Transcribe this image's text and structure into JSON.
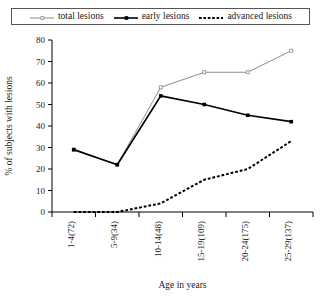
{
  "chart_data": {
    "type": "line",
    "title": "",
    "xlabel": "Age in years",
    "ylabel": "% of subjects with lesions",
    "categories": [
      "1-4(72)",
      "5-9(34)",
      "10-14(48)",
      "15-19(109)",
      "20-24(175)",
      "25-29(137)"
    ],
    "ylim": [
      0,
      80
    ],
    "yticks": [
      0,
      10,
      20,
      30,
      40,
      50,
      60,
      70,
      80
    ],
    "grid": false,
    "legend_position": "top",
    "series": [
      {
        "name": "total lesions",
        "values": [
          29,
          22,
          58,
          65,
          65,
          75
        ],
        "color": "#8c8c8c",
        "style": "solid-thin",
        "marker": "open-square"
      },
      {
        "name": "early lesions",
        "values": [
          29,
          22,
          54,
          50,
          45,
          42
        ],
        "color": "#000000",
        "style": "solid-thick",
        "marker": "filled-square"
      },
      {
        "name": "advanced lesions",
        "values": [
          0,
          0,
          4,
          15,
          20,
          33
        ],
        "color": "#000000",
        "style": "dotted-thick",
        "marker": "none"
      }
    ]
  },
  "legend": {
    "items": [
      {
        "label": "total lesions",
        "icon": "thin-gray-line-icon"
      },
      {
        "label": "early lesions",
        "icon": "thick-black-line-square-marker-icon"
      },
      {
        "label": "advanced lesions",
        "icon": "dotted-black-line-icon"
      }
    ]
  },
  "axes": {
    "y_title": "% of subjects with lesions",
    "x_title": "Age in years",
    "y_tick_labels": [
      "80",
      "70",
      "60",
      "50",
      "40",
      "30",
      "20",
      "10",
      "0"
    ],
    "x_tick_labels": [
      "1-4(72)",
      "5-9(34)",
      "10-14(48)",
      "15-19(109)",
      "20-24(175)",
      "25-29(137)"
    ]
  }
}
